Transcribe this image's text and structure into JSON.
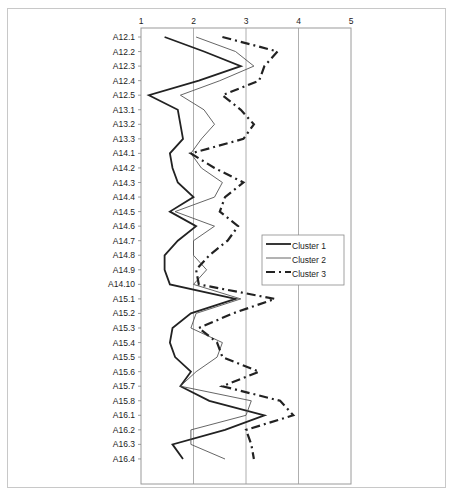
{
  "chart_data": {
    "type": "line",
    "orientation": "horizontal-profile",
    "title": "",
    "xlabel": "",
    "ylabel": "",
    "xlim": [
      1,
      5
    ],
    "x_ticks": [
      "1",
      "2",
      "3",
      "4",
      "5"
    ],
    "grid": "vertical",
    "legend_position": "right-middle",
    "categories": [
      "A12.1",
      "A12.2",
      "A12.3",
      "A12.4",
      "A12.5",
      "A13.1",
      "A13.2",
      "A13.3",
      "A14.1",
      "A14.2",
      "A14.3",
      "A14.4",
      "A14.5",
      "A14.6",
      "A14.7",
      "A14.8",
      "A14.9",
      "A14.10",
      "A15.1",
      "A15.2",
      "A15.3",
      "A15.4",
      "A15.5",
      "A15.6",
      "A15.7",
      "A15.8",
      "A16.1",
      "A16.2",
      "A16.3",
      "A16.4"
    ],
    "series": [
      {
        "name": "Cluster 1",
        "style": "solid-thick",
        "color": "#222222",
        "values": [
          1.45,
          2.2,
          2.9,
          2.1,
          1.15,
          1.7,
          1.75,
          1.8,
          1.55,
          1.6,
          1.7,
          2.0,
          1.55,
          2.05,
          1.7,
          1.45,
          1.45,
          1.55,
          2.8,
          1.95,
          1.6,
          1.55,
          1.65,
          1.95,
          1.75,
          2.3,
          3.35,
          2.6,
          1.6,
          1.8
        ]
      },
      {
        "name": "Cluster 2",
        "style": "solid-thin",
        "color": "#555555",
        "values": [
          2.05,
          2.8,
          3.15,
          2.5,
          1.75,
          2.2,
          2.4,
          2.15,
          1.95,
          2.15,
          2.55,
          2.4,
          1.65,
          2.4,
          2.0,
          2.0,
          2.25,
          2.0,
          2.9,
          2.05,
          1.95,
          2.55,
          2.45,
          2.05,
          1.75,
          3.1,
          3.0,
          1.95,
          1.95,
          2.6
        ]
      },
      {
        "name": "Cluster 3",
        "style": "dash-dot-thick",
        "color": "#222222",
        "values": [
          2.55,
          3.6,
          3.35,
          3.25,
          2.55,
          2.9,
          3.15,
          2.95,
          1.95,
          2.4,
          2.95,
          2.6,
          2.5,
          2.85,
          2.65,
          2.3,
          2.05,
          2.1,
          3.55,
          2.75,
          2.1,
          2.45,
          2.55,
          3.25,
          2.55,
          3.65,
          3.9,
          3.0,
          3.1,
          3.15
        ]
      }
    ]
  },
  "legend": {
    "items": [
      {
        "label": "Cluster 1"
      },
      {
        "label": "Cluster 2"
      },
      {
        "label": "Cluster 3"
      }
    ]
  }
}
